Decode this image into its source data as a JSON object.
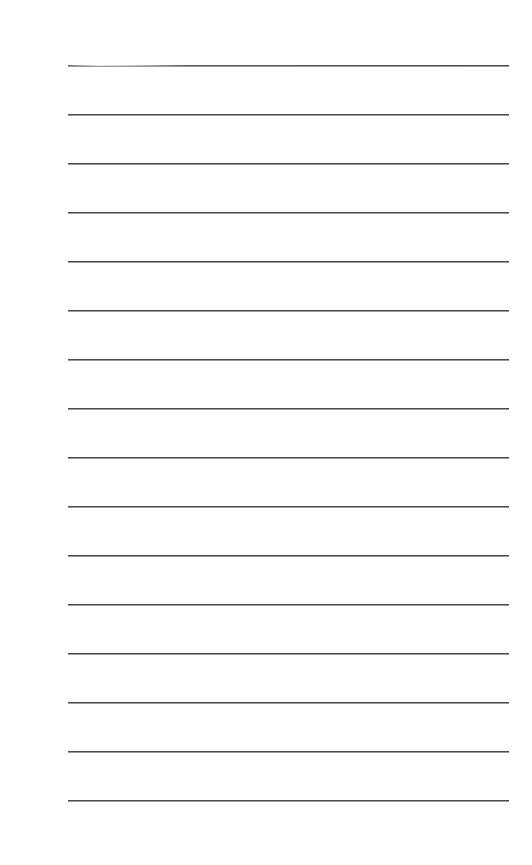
{
  "document": {
    "type": "lined-paper",
    "background_color": "#ffffff",
    "rule_color": "#4a4a4a",
    "rule_count": 16,
    "rule_left_px": 68,
    "rule_right_px": 509,
    "rules_y": [
      65,
      114,
      163,
      212,
      261,
      310,
      359,
      408,
      457,
      506,
      555,
      604,
      653,
      702,
      751,
      800
    ]
  }
}
